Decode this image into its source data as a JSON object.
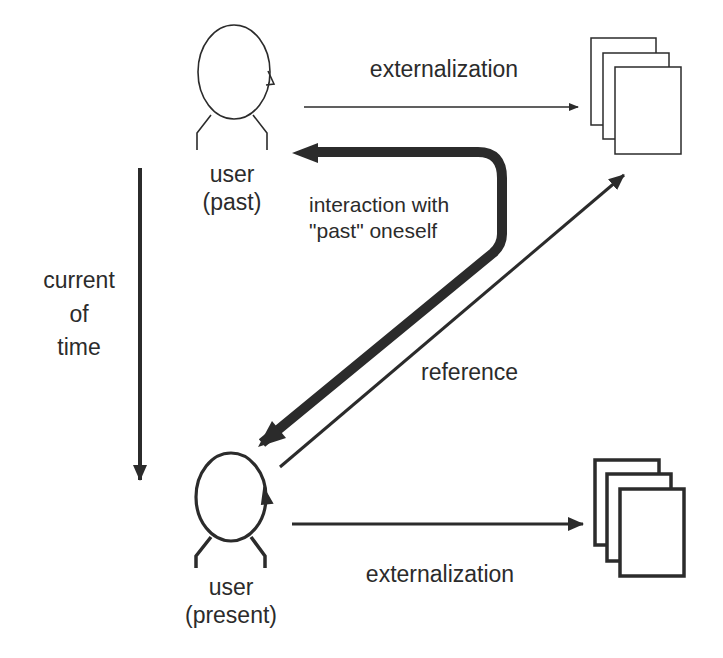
{
  "diagram": {
    "colors": {
      "stroke": "#2b2b2b",
      "background": "#ffffff"
    },
    "actors": {
      "past": {
        "line1": "user",
        "line2": "(past)"
      },
      "present": {
        "line1": "user",
        "line2": "(present)"
      }
    },
    "labels": {
      "externalization_top": "externalization",
      "externalization_bottom": "externalization",
      "interaction_line1": "interaction with",
      "interaction_line2": "\"past\" oneself",
      "reference": "reference",
      "time_line1": "current",
      "time_line2": "of",
      "time_line3": "time"
    },
    "documents": {
      "past_stack_count": 3,
      "present_stack_count": 3
    }
  }
}
